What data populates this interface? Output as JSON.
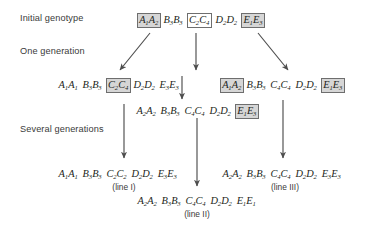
{
  "figure": {
    "stage_labels": [
      {
        "key": "initial",
        "text": "Initial genotype"
      },
      {
        "key": "one_generation",
        "text": "One generation"
      },
      {
        "key": "several_generations",
        "text": "Several generations"
      }
    ],
    "genotypes": {
      "initial": {
        "loci": [
          {
            "alleles": [
              [
                "A",
                "1"
              ],
              [
                "A",
                "2"
              ]
            ],
            "boxed": true,
            "shaded": true
          },
          {
            "alleles": [
              [
                "B",
                "3"
              ],
              [
                "B",
                "3"
              ]
            ],
            "boxed": false,
            "shaded": false
          },
          {
            "alleles": [
              [
                "C",
                "2"
              ],
              [
                "C",
                "4"
              ]
            ],
            "boxed": true,
            "shaded": false
          },
          {
            "alleles": [
              [
                "D",
                "2"
              ],
              [
                "D",
                "2"
              ]
            ],
            "boxed": false,
            "shaded": false
          },
          {
            "alleles": [
              [
                "E",
                "1"
              ],
              [
                "E",
                "3"
              ]
            ],
            "boxed": true,
            "shaded": true
          }
        ]
      },
      "gen1_left": {
        "loci": [
          {
            "alleles": [
              [
                "A",
                "1"
              ],
              [
                "A",
                "1"
              ]
            ],
            "boxed": false,
            "shaded": false
          },
          {
            "alleles": [
              [
                "B",
                "3"
              ],
              [
                "B",
                "3"
              ]
            ],
            "boxed": false,
            "shaded": false
          },
          {
            "alleles": [
              [
                "C",
                "2"
              ],
              [
                "C",
                "4"
              ]
            ],
            "boxed": true,
            "shaded": true
          },
          {
            "alleles": [
              [
                "D",
                "2"
              ],
              [
                "D",
                "2"
              ]
            ],
            "boxed": false,
            "shaded": false
          },
          {
            "alleles": [
              [
                "E",
                "3"
              ],
              [
                "E",
                "3"
              ]
            ],
            "boxed": false,
            "shaded": false
          }
        ]
      },
      "gen1_right": {
        "loci": [
          {
            "alleles": [
              [
                "A",
                "1"
              ],
              [
                "A",
                "2"
              ]
            ],
            "boxed": true,
            "shaded": true
          },
          {
            "alleles": [
              [
                "B",
                "3"
              ],
              [
                "B",
                "3"
              ]
            ],
            "boxed": false,
            "shaded": false
          },
          {
            "alleles": [
              [
                "C",
                "4"
              ],
              [
                "C",
                "4"
              ]
            ],
            "boxed": false,
            "shaded": false
          },
          {
            "alleles": [
              [
                "D",
                "2"
              ],
              [
                "D",
                "2"
              ]
            ],
            "boxed": false,
            "shaded": false
          },
          {
            "alleles": [
              [
                "E",
                "1"
              ],
              [
                "E",
                "3"
              ]
            ],
            "boxed": true,
            "shaded": true
          }
        ]
      },
      "gen1_middle": {
        "loci": [
          {
            "alleles": [
              [
                "A",
                "2"
              ],
              [
                "A",
                "2"
              ]
            ],
            "boxed": false,
            "shaded": false
          },
          {
            "alleles": [
              [
                "B",
                "3"
              ],
              [
                "B",
                "3"
              ]
            ],
            "boxed": false,
            "shaded": false
          },
          {
            "alleles": [
              [
                "C",
                "4"
              ],
              [
                "C",
                "4"
              ]
            ],
            "boxed": false,
            "shaded": false
          },
          {
            "alleles": [
              [
                "D",
                "2"
              ],
              [
                "D",
                "2"
              ]
            ],
            "boxed": false,
            "shaded": false
          },
          {
            "alleles": [
              [
                "E",
                "1"
              ],
              [
                "E",
                "3"
              ]
            ],
            "boxed": true,
            "shaded": true
          }
        ]
      },
      "line_I": {
        "loci": [
          {
            "alleles": [
              [
                "A",
                "1"
              ],
              [
                "A",
                "1"
              ]
            ],
            "boxed": false,
            "shaded": false
          },
          {
            "alleles": [
              [
                "B",
                "3"
              ],
              [
                "B",
                "3"
              ]
            ],
            "boxed": false,
            "shaded": false
          },
          {
            "alleles": [
              [
                "C",
                "2"
              ],
              [
                "C",
                "2"
              ]
            ],
            "boxed": false,
            "shaded": false
          },
          {
            "alleles": [
              [
                "D",
                "2"
              ],
              [
                "D",
                "2"
              ]
            ],
            "boxed": false,
            "shaded": false
          },
          {
            "alleles": [
              [
                "E",
                "3"
              ],
              [
                "E",
                "3"
              ]
            ],
            "boxed": false,
            "shaded": false
          }
        ]
      },
      "line_II": {
        "loci": [
          {
            "alleles": [
              [
                "A",
                "2"
              ],
              [
                "A",
                "2"
              ]
            ],
            "boxed": false,
            "shaded": false
          },
          {
            "alleles": [
              [
                "B",
                "3"
              ],
              [
                "B",
                "3"
              ]
            ],
            "boxed": false,
            "shaded": false
          },
          {
            "alleles": [
              [
                "C",
                "4"
              ],
              [
                "C",
                "4"
              ]
            ],
            "boxed": false,
            "shaded": false
          },
          {
            "alleles": [
              [
                "D",
                "2"
              ],
              [
                "D",
                "2"
              ]
            ],
            "boxed": false,
            "shaded": false
          },
          {
            "alleles": [
              [
                "E",
                "1"
              ],
              [
                "E",
                "1"
              ]
            ],
            "boxed": false,
            "shaded": false
          }
        ]
      },
      "line_III": {
        "loci": [
          {
            "alleles": [
              [
                "A",
                "2"
              ],
              [
                "A",
                "2"
              ]
            ],
            "boxed": false,
            "shaded": false
          },
          {
            "alleles": [
              [
                "B",
                "3"
              ],
              [
                "B",
                "3"
              ]
            ],
            "boxed": false,
            "shaded": false
          },
          {
            "alleles": [
              [
                "C",
                "4"
              ],
              [
                "C",
                "4"
              ]
            ],
            "boxed": false,
            "shaded": false
          },
          {
            "alleles": [
              [
                "D",
                "2"
              ],
              [
                "D",
                "2"
              ]
            ],
            "boxed": false,
            "shaded": false
          },
          {
            "alleles": [
              [
                "E",
                "3"
              ],
              [
                "E",
                "3"
              ]
            ],
            "boxed": false,
            "shaded": false
          }
        ]
      }
    },
    "line_labels": [
      {
        "key": "line_I",
        "text": "(line I)"
      },
      {
        "key": "line_II",
        "text": "(line II)"
      },
      {
        "key": "line_III",
        "text": "(line III)"
      }
    ],
    "colors": {
      "text": "#231f20",
      "label_text": "#3a3a3a",
      "box_fill": "#d6d6d6",
      "box_stroke": "#6e6e6e",
      "arrow": "#4d4d4d",
      "background": "#ffffff"
    }
  }
}
